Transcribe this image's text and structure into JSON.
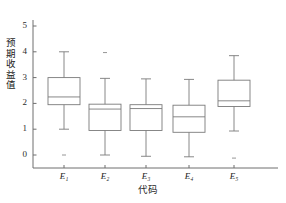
{
  "chart_data": {
    "type": "box",
    "title": "",
    "xlabel": "代码",
    "ylabel": "预期收益值",
    "ylim": [
      -0.45,
      5.45
    ],
    "yticks": [
      0,
      1,
      2,
      3,
      4,
      5
    ],
    "ytick_labels": [
      "0",
      "1",
      "2",
      "3",
      "4",
      "5"
    ],
    "categories": [
      "E1",
      "E2",
      "E3",
      "E4",
      "E5"
    ],
    "xtick_labels": [
      "E₁",
      "E₂",
      "E₃",
      "E₄",
      "E₅"
    ],
    "grid": false,
    "legend": null,
    "boxes": [
      {
        "category": "E1",
        "whisker_low": 1.0,
        "q1": 1.95,
        "median": 2.25,
        "q3": 3.0,
        "whisker_high": 4.0,
        "outliers": [
          0.0
        ]
      },
      {
        "category": "E2",
        "whisker_low": 0.0,
        "q1": 0.95,
        "median": 1.78,
        "q3": 1.97,
        "whisker_high": 2.97,
        "outliers": [
          3.97
        ]
      },
      {
        "category": "E3",
        "whisker_low": -0.05,
        "q1": 0.95,
        "median": 1.8,
        "q3": 1.95,
        "whisker_high": 2.95,
        "outliers": []
      },
      {
        "category": "E4",
        "whisker_low": -0.07,
        "q1": 0.88,
        "median": 1.48,
        "q3": 1.93,
        "whisker_high": 2.93,
        "outliers": []
      },
      {
        "category": "E5",
        "whisker_low": 0.93,
        "q1": 1.88,
        "median": 2.1,
        "q3": 2.9,
        "whisker_high": 3.85,
        "outliers": [
          -0.12
        ]
      }
    ],
    "colors": {
      "box_stroke": "#7a7a7a",
      "axis": "#6e6e6e",
      "text": "#1d1d1d",
      "background": "#ffffff"
    }
  }
}
